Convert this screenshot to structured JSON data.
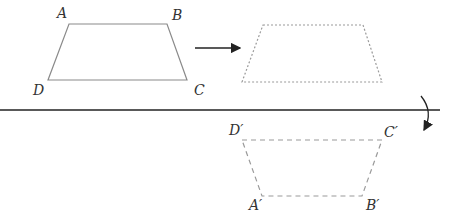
{
  "diagram": {
    "original": {
      "labels": {
        "A": "A",
        "B": "B",
        "C": "C",
        "D": "D"
      },
      "points": {
        "A": [
          69,
          24
        ],
        "B": [
          167,
          24
        ],
        "C": [
          187,
          80
        ],
        "D": [
          48,
          80
        ]
      }
    },
    "translated": {
      "points": {
        "A": [
          263,
          25
        ],
        "B": [
          363,
          25
        ],
        "C": [
          382,
          82
        ],
        "D": [
          242,
          82
        ]
      }
    },
    "reflected": {
      "labels": {
        "A": "A′",
        "B": "B′",
        "C": "C′",
        "D": "D′"
      },
      "points": {
        "A": [
          262,
          196
        ],
        "B": [
          362,
          196
        ],
        "C": [
          382,
          140
        ],
        "D": [
          242,
          140
        ]
      }
    },
    "mirror_line": {
      "y": 110,
      "x1": 0,
      "x2": 440
    },
    "colors": {
      "shape": "#8a8a8a",
      "line": "#222222",
      "dashed": "#9a9a9a"
    }
  }
}
